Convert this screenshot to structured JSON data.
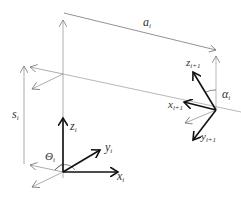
{
  "diagram": {
    "type": "Denavit-Hartenberg frame diagram",
    "labels": {
      "a": "a",
      "a_sub": "i",
      "alpha": "α",
      "alpha_sub": "i",
      "s": "s",
      "s_sub": "i",
      "theta": "Θ",
      "theta_sub": "i",
      "z_i": "z",
      "z_i_sub": "i",
      "y_i": "y",
      "y_i_sub": "i",
      "x_i": "x",
      "x_i_sub": "i",
      "z_next": "z",
      "z_next_sub": "i+1",
      "x_next": "x",
      "x_next_sub": "i+1",
      "y_next": "y",
      "y_next_sub": "i+1"
    },
    "colors": {
      "thin_line": "#888888",
      "bold_axis": "#111111",
      "text": "#333333"
    }
  }
}
